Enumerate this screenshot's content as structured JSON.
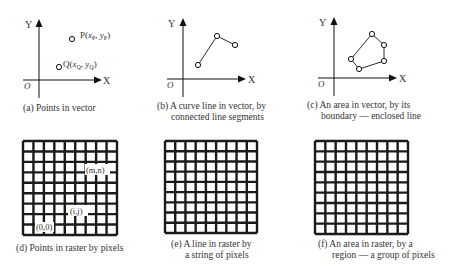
{
  "figure": {
    "panels": [
      {
        "id": "a",
        "type": "vector-points",
        "caption": [
          "(a)  Points in vector"
        ],
        "axes": {
          "x_label": "X",
          "y_label": "Y",
          "origin_label": "O"
        },
        "points": [
          {
            "label": "P(x_P, y_P)",
            "label_main": "P(",
            "label_x": "x",
            "label_xsub": "P",
            "label_sep": ", ",
            "label_y": "y",
            "label_ysub": "P",
            "label_end": ")"
          },
          {
            "label": "Q(x_Q, y_Q)",
            "label_main": "Q(",
            "label_x": "x",
            "label_xsub": "Q",
            "label_sep": ", ",
            "label_y": "y",
            "label_ysub": "Q",
            "label_end": ")"
          }
        ]
      },
      {
        "id": "b",
        "type": "vector-line",
        "caption": [
          "(b)  A curve line in vector, by",
          "connected line segments"
        ],
        "axes": {
          "x_label": "X",
          "y_label": "Y",
          "origin_label": "O"
        }
      },
      {
        "id": "c",
        "type": "vector-area",
        "caption": [
          "(c)  An area in vector, by its",
          "boundary — enclosed line"
        ],
        "axes": {
          "x_label": "X",
          "y_label": "Y",
          "origin_label": "O"
        }
      },
      {
        "id": "d",
        "type": "raster-points",
        "caption": [
          "(d)  Points in raster by pixels"
        ],
        "grid": {
          "rows": 9,
          "cols": 9
        },
        "labels": [
          "(m,n)",
          "(i,j)",
          "(0,0)"
        ]
      },
      {
        "id": "e",
        "type": "raster-line",
        "caption": [
          "(e)  A line in raster by",
          "a string of pixels"
        ],
        "grid": {
          "rows": 9,
          "cols": 9
        }
      },
      {
        "id": "f",
        "type": "raster-area",
        "caption": [
          "(f)  An area in raster, by a",
          "region — a group of pixels"
        ],
        "grid": {
          "rows": 9,
          "cols": 9
        }
      }
    ],
    "colors": {
      "line": "#111111",
      "text": "#333333",
      "background": "#ffffff"
    }
  }
}
